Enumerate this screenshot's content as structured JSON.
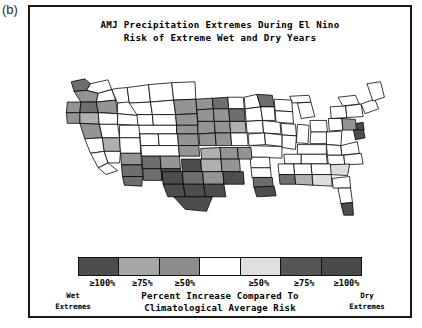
{
  "panel": {
    "label": "(b)"
  },
  "title": {
    "line1": "AMJ Precipitation Extremes During El Nino",
    "line2": "Risk of Extreme Wet and Dry Years"
  },
  "legend": {
    "caption_line1": "Percent Increase Compared To",
    "caption_line2": "Climatological Average Risk",
    "wet_label_line1": "Wet",
    "wet_label_line2": "Extremes",
    "dry_label_line1": "Dry",
    "dry_label_line2": "Extremes",
    "ticks": [
      {
        "text": "≥100%",
        "pos": 4
      },
      {
        "text": "≥75%",
        "pos": 19
      },
      {
        "text": "≥50%",
        "pos": 34
      },
      {
        "text": "≥50%",
        "pos": 60
      },
      {
        "text": "≥75%",
        "pos": 76
      },
      {
        "text": "≥100%",
        "pos": 90
      }
    ],
    "swatches": [
      {
        "name": "wet-ge-100",
        "color": "#4d4d4d"
      },
      {
        "name": "wet-ge-75",
        "color": "#a6a6a6"
      },
      {
        "name": "wet-ge-50",
        "color": "#8c8c8c"
      },
      {
        "name": "neutral",
        "color": "#ffffff"
      },
      {
        "name": "dry-ge-50",
        "color": "#e0e0e0"
      },
      {
        "name": "dry-ge-75",
        "color": "#565656"
      },
      {
        "name": "dry-ge-100",
        "color": "#4a4a4a"
      }
    ]
  },
  "map": {
    "name": "united-states-climate-divisions",
    "outline_color": "#000000",
    "background": "#ffffff",
    "fill_palette": {
      "white": "#ffffff",
      "light": "#dddddd",
      "mid_light": "#b0b0b0",
      "mid": "#949494",
      "dark": "#6e6e6e",
      "very_dark": "#4d4d4d"
    },
    "divisions": [
      {
        "id": "wa-nw",
        "shade": "dark",
        "d": "M24 12 L38 9 L44 14 L40 21 L27 22 Z"
      },
      {
        "id": "wa-ne",
        "shade": "white",
        "d": "M44 14 L62 10 L66 20 L52 24 L40 21 Z"
      },
      {
        "id": "wa-c",
        "shade": "mid",
        "d": "M40 21 L52 24 L50 33 L34 33 L27 22 Z"
      },
      {
        "id": "wa-se",
        "shade": "white",
        "d": "M52 24 L66 20 L70 31 L50 33 Z"
      },
      {
        "id": "or-nw",
        "shade": "mid",
        "d": "M20 33 L34 33 L33 44 L19 44 Z"
      },
      {
        "id": "or-ne",
        "shade": "dark",
        "d": "M34 33 L50 33 L52 44 L33 44 Z"
      },
      {
        "id": "or-e",
        "shade": "mid",
        "d": "M50 33 L70 31 L72 45 L52 44 Z"
      },
      {
        "id": "or-sw",
        "shade": "mid",
        "d": "M19 44 L33 44 L33 55 L20 55 Z"
      },
      {
        "id": "or-se",
        "shade": "mid_light",
        "d": "M33 44 L52 44 L53 56 L33 55 Z"
      },
      {
        "id": "or-sc",
        "shade": "white",
        "d": "M52 44 L72 45 L72 56 L53 56 Z"
      },
      {
        "id": "id-n",
        "shade": "white",
        "d": "M70 19 L82 18 L84 34 L72 34 L66 20 Z"
      },
      {
        "id": "id-c",
        "shade": "white",
        "d": "M72 34 L92 32 L94 47 L72 45 Z"
      },
      {
        "id": "id-s",
        "shade": "white",
        "d": "M72 45 L94 47 L94 57 L72 56 Z"
      },
      {
        "id": "mt-w",
        "shade": "white",
        "d": "M82 18 L104 15 L106 33 L84 34 Z"
      },
      {
        "id": "mt-c",
        "shade": "white",
        "d": "M104 15 L128 13 L130 31 L106 33 Z"
      },
      {
        "id": "mt-ne",
        "shade": "white",
        "d": "M128 13 L152 12 L153 30 L130 31 Z"
      },
      {
        "id": "mt-s",
        "shade": "white",
        "d": "M84 34 L106 33 L108 46 L92 46 Z"
      },
      {
        "id": "mt-sc",
        "shade": "white",
        "d": "M106 33 L130 31 L132 46 L108 46 Z"
      },
      {
        "id": "mt-se",
        "shade": "mid",
        "d": "M130 31 L153 30 L154 45 L132 46 Z"
      },
      {
        "id": "nd-w",
        "shade": "mid",
        "d": "M153 30 L170 29 L171 40 L154 41 Z"
      },
      {
        "id": "nd-c",
        "shade": "dark",
        "d": "M170 29 L186 28 L187 40 L171 40 Z"
      },
      {
        "id": "nd-e",
        "shade": "white",
        "d": "M186 28 L202 28 L203 40 L187 40 Z"
      },
      {
        "id": "sd-w",
        "shade": "mid",
        "d": "M154 41 L171 40 L172 53 L155 53 Z"
      },
      {
        "id": "sd-c",
        "shade": "mid",
        "d": "M171 40 L187 40 L188 53 L172 53 Z"
      },
      {
        "id": "sd-e",
        "shade": "dark",
        "d": "M187 40 L203 40 L204 53 L188 53 Z"
      },
      {
        "id": "wy-nw",
        "shade": "white",
        "d": "M92 46 L108 46 L109 57 L93 57 Z"
      },
      {
        "id": "wy-ne",
        "shade": "white",
        "d": "M108 46 L132 46 L133 57 L109 57 Z"
      },
      {
        "id": "wy-e",
        "shade": "mid",
        "d": "M132 46 L154 45 L155 57 L133 57 Z"
      },
      {
        "id": "wy-s",
        "shade": "white",
        "d": "M93 57 L133 57 L133 66 L94 66 Z"
      },
      {
        "id": "wy-se",
        "shade": "mid",
        "d": "M133 57 L155 57 L155 66 L133 66 Z"
      },
      {
        "id": "ne-w",
        "shade": "mid",
        "d": "M155 53 L172 53 L173 65 L155 66 Z"
      },
      {
        "id": "ne-c",
        "shade": "mid",
        "d": "M172 53 L188 53 L189 65 L173 65 Z"
      },
      {
        "id": "ne-e",
        "shade": "mid_light",
        "d": "M188 53 L204 53 L205 65 L189 65 Z"
      },
      {
        "id": "mn-nw",
        "shade": "white",
        "d": "M203 28 L216 25 L220 38 L204 40 Z"
      },
      {
        "id": "mn-ne",
        "shade": "dark",
        "d": "M216 25 L232 26 L234 38 L220 38 Z"
      },
      {
        "id": "mn-s",
        "shade": "white",
        "d": "M204 40 L220 38 L222 52 L205 53 Z"
      },
      {
        "id": "mn-se",
        "shade": "white",
        "d": "M220 38 L234 38 L235 52 L222 52 Z"
      },
      {
        "id": "wi-n",
        "shade": "white",
        "d": "M234 30 L252 31 L253 43 L235 42 Z"
      },
      {
        "id": "wi-s",
        "shade": "white",
        "d": "M235 42 L253 43 L254 55 L236 54 Z"
      },
      {
        "id": "ia-w",
        "shade": "white",
        "d": "M205 53 L222 52 L223 65 L206 65 Z"
      },
      {
        "id": "ia-e",
        "shade": "white",
        "d": "M222 52 L240 54 L241 66 L223 65 Z"
      },
      {
        "id": "il-n",
        "shade": "white",
        "d": "M241 55 L256 56 L257 68 L242 67 Z"
      },
      {
        "id": "il-s",
        "shade": "white",
        "d": "M242 67 L257 68 L256 82 L242 80 Z"
      },
      {
        "id": "mi-lp",
        "shade": "white",
        "d": "M258 34 L272 33 L276 48 L262 50 Z"
      },
      {
        "id": "mi-up",
        "shade": "white",
        "d": "M250 27 L270 26 L272 33 L253 34 Z"
      },
      {
        "id": "in",
        "shade": "white",
        "d": "M258 56 L270 57 L269 76 L257 75 Z"
      },
      {
        "id": "oh-n",
        "shade": "white",
        "d": "M271 52 L288 52 L289 64 L272 64 Z"
      },
      {
        "id": "oh-s",
        "shade": "white",
        "d": "M272 64 L289 64 L288 76 L271 76 Z"
      },
      {
        "id": "pa-w",
        "shade": "white",
        "d": "M290 50 L304 50 L305 62 L291 63 Z"
      },
      {
        "id": "pa-e",
        "shade": "mid",
        "d": "M304 50 L318 51 L319 62 L305 62 Z"
      },
      {
        "id": "ny-w",
        "shade": "white",
        "d": "M292 38 L308 37 L309 49 L293 50 Z"
      },
      {
        "id": "ny-e",
        "shade": "white",
        "d": "M308 37 L324 35 L326 48 L309 49 Z"
      },
      {
        "id": "ny-n",
        "shade": "white",
        "d": "M300 28 L318 26 L322 35 L305 37 Z"
      },
      {
        "id": "ne-states",
        "shade": "white",
        "d": "M324 35 L338 30 L342 40 L328 45 Z"
      },
      {
        "id": "me",
        "shade": "white",
        "d": "M330 14 L344 12 L348 28 L336 32 Z"
      },
      {
        "id": "nv-n",
        "shade": "white",
        "d": "M53 56 L72 56 L74 70 L56 70 Z"
      },
      {
        "id": "nv-c",
        "shade": "mid_light",
        "d": "M56 70 L74 70 L75 84 L58 84 Z"
      },
      {
        "id": "nv-s",
        "shade": "white",
        "d": "M58 84 L75 84 L74 96 L62 96 Z"
      },
      {
        "id": "ca-n",
        "shade": "mid",
        "d": "M33 55 L53 56 L56 70 L38 71 Z"
      },
      {
        "id": "ca-c",
        "shade": "white",
        "d": "M38 71 L56 70 L58 84 L44 86 Z"
      },
      {
        "id": "ca-s",
        "shade": "white",
        "d": "M44 86 L58 84 L62 96 L52 101 Z"
      },
      {
        "id": "ca-sw",
        "shade": "white",
        "d": "M52 101 L62 96 L72 104 L60 108 Z"
      },
      {
        "id": "ut-n",
        "shade": "white",
        "d": "M74 57 L94 57 L95 70 L74 70 Z"
      },
      {
        "id": "ut-s",
        "shade": "white",
        "d": "M74 70 L95 70 L96 86 L75 86 Z"
      },
      {
        "id": "co-nw",
        "shade": "white",
        "d": "M95 66 L114 66 L115 78 L96 78 Z"
      },
      {
        "id": "co-ne",
        "shade": "white",
        "d": "M114 66 L134 66 L135 78 L115 78 Z"
      },
      {
        "id": "co-e",
        "shade": "mid",
        "d": "M134 66 L155 66 L156 78 L135 78 Z"
      },
      {
        "id": "co-s",
        "shade": "white",
        "d": "M96 78 L135 78 L136 89 L97 89 Z"
      },
      {
        "id": "co-se",
        "shade": "mid",
        "d": "M135 78 L156 78 L157 89 L136 89 Z"
      },
      {
        "id": "ks-w",
        "shade": "mid",
        "d": "M156 66 L173 65 L174 78 L157 78 Z"
      },
      {
        "id": "ks-c",
        "shade": "mid",
        "d": "M173 65 L189 65 L190 78 L174 78 Z"
      },
      {
        "id": "ks-e",
        "shade": "white",
        "d": "M189 65 L206 65 L207 78 L190 78 Z"
      },
      {
        "id": "mo-nw",
        "shade": "white",
        "d": "M207 66 L224 65 L225 77 L208 78 Z"
      },
      {
        "id": "mo-ne",
        "shade": "white",
        "d": "M224 65 L242 67 L242 79 L225 77 Z"
      },
      {
        "id": "mo-s",
        "shade": "white",
        "d": "M208 78 L242 79 L242 91 L209 90 Z"
      },
      {
        "id": "ky",
        "shade": "white",
        "d": "M258 77 L288 77 L288 87 L258 87 Z"
      },
      {
        "id": "wv",
        "shade": "white",
        "d": "M288 64 L304 63 L303 78 L288 77 Z"
      },
      {
        "id": "va-w",
        "shade": "white",
        "d": "M288 77 L303 78 L304 88 L289 88 Z"
      },
      {
        "id": "va-e",
        "shade": "white",
        "d": "M303 78 L320 74 L322 86 L304 88 Z"
      },
      {
        "id": "md-de",
        "shade": "very_dark",
        "d": "M316 62 L326 60 L328 70 L318 72 Z"
      },
      {
        "id": "nj",
        "shade": "very_dark",
        "d": "M319 55 L326 54 L327 62 L320 62 Z"
      },
      {
        "id": "nc-w",
        "shade": "white",
        "d": "M289 88 L306 88 L307 98 L290 98 Z"
      },
      {
        "id": "nc-e",
        "shade": "white",
        "d": "M306 88 L324 86 L326 97 L307 98 Z"
      },
      {
        "id": "tn-w",
        "shade": "white",
        "d": "M244 87 L262 87 L262 97 L245 97 Z"
      },
      {
        "id": "tn-e",
        "shade": "white",
        "d": "M262 87 L288 87 L289 97 L262 97 Z"
      },
      {
        "id": "sc",
        "shade": "light",
        "d": "M290 98 L312 97 L310 109 L292 108 Z"
      },
      {
        "id": "ga-n",
        "shade": "white",
        "d": "M272 97 L292 97 L293 108 L273 108 Z"
      },
      {
        "id": "ga-s",
        "shade": "light",
        "d": "M273 108 L293 108 L294 120 L274 119 Z"
      },
      {
        "id": "al-n",
        "shade": "white",
        "d": "M254 97 L272 97 L273 108 L255 108 Z"
      },
      {
        "id": "al-s",
        "shade": "mid_light",
        "d": "M255 108 L273 108 L274 119 L256 118 Z"
      },
      {
        "id": "ms-n",
        "shade": "white",
        "d": "M238 97 L254 97 L255 108 L239 108 Z"
      },
      {
        "id": "ms-s",
        "shade": "dark",
        "d": "M239 108 L255 108 L256 118 L240 118 Z"
      },
      {
        "id": "ar-n",
        "shade": "white",
        "d": "M209 90 L229 90 L230 101 L210 101 Z"
      },
      {
        "id": "ar-s",
        "shade": "white",
        "d": "M210 101 L230 101 L231 111 L211 111 Z"
      },
      {
        "id": "la-n",
        "shade": "dark",
        "d": "M212 111 L232 111 L233 121 L213 121 Z"
      },
      {
        "id": "la-s",
        "shade": "very_dark",
        "d": "M213 121 L234 120 L236 130 L216 131 Z"
      },
      {
        "id": "ok-w",
        "shade": "mid_light",
        "d": "M158 81 L178 80 L179 92 L159 92 Z"
      },
      {
        "id": "ok-c",
        "shade": "mid",
        "d": "M178 80 L196 80 L197 92 L179 92 Z"
      },
      {
        "id": "ok-e",
        "shade": "mid",
        "d": "M196 80 L210 80 L211 92 L197 92 Z"
      },
      {
        "id": "nm-nw",
        "shade": "dark",
        "d": "M97 89 L116 89 L117 102 L98 102 Z"
      },
      {
        "id": "nm-ne",
        "shade": "mid",
        "d": "M116 89 L136 89 L137 102 L117 102 Z"
      },
      {
        "id": "nm-sw",
        "shade": "dark",
        "d": "M98 102 L117 102 L118 114 L99 114 Z"
      },
      {
        "id": "nm-se",
        "shade": "very_dark",
        "d": "M117 102 L137 102 L138 114 L118 114 Z"
      },
      {
        "id": "az-n",
        "shade": "mid",
        "d": "M75 86 L96 86 L97 98 L76 98 Z"
      },
      {
        "id": "az-c",
        "shade": "dark",
        "d": "M76 98 L97 98 L98 110 L77 110 Z"
      },
      {
        "id": "az-s",
        "shade": "dark",
        "d": "M77 110 L98 110 L97 120 L79 119 Z"
      },
      {
        "id": "tx-nw",
        "shade": "very_dark",
        "d": "M138 92 L158 92 L159 105 L139 105 Z"
      },
      {
        "id": "tx-n",
        "shade": "mid_light",
        "d": "M158 92 L179 92 L180 105 L159 105 Z"
      },
      {
        "id": "tx-ne",
        "shade": "mid",
        "d": "M179 92 L198 92 L199 105 L180 105 Z"
      },
      {
        "id": "tx-w",
        "shade": "very_dark",
        "d": "M118 105 L139 105 L140 118 L119 118 Z"
      },
      {
        "id": "tx-c",
        "shade": "dark",
        "d": "M139 105 L160 105 L161 118 L140 118 Z"
      },
      {
        "id": "tx-ec",
        "shade": "mid",
        "d": "M160 105 L181 105 L182 118 L161 118 Z"
      },
      {
        "id": "tx-e",
        "shade": "very_dark",
        "d": "M181 105 L202 105 L203 118 L182 118 Z"
      },
      {
        "id": "tx-sw",
        "shade": "very_dark",
        "d": "M119 118 L140 118 L142 131 L124 131 Z"
      },
      {
        "id": "tx-sc",
        "shade": "very_dark",
        "d": "M140 118 L161 118 L163 131 L142 131 Z"
      },
      {
        "id": "tx-se",
        "shade": "very_dark",
        "d": "M161 118 L182 118 L184 131 L163 131 Z"
      },
      {
        "id": "tx-s",
        "shade": "very_dark",
        "d": "M130 131 L170 131 L164 146 L142 144 Z"
      },
      {
        "id": "fl-n",
        "shade": "white",
        "d": "M294 112 L312 110 L313 122 L295 122 Z"
      },
      {
        "id": "fl-c",
        "shade": "white",
        "d": "M300 122 L313 122 L315 137 L303 138 Z"
      },
      {
        "id": "fl-s",
        "shade": "very_dark",
        "d": "M303 138 L315 137 L316 150 L306 150 Z"
      }
    ]
  }
}
